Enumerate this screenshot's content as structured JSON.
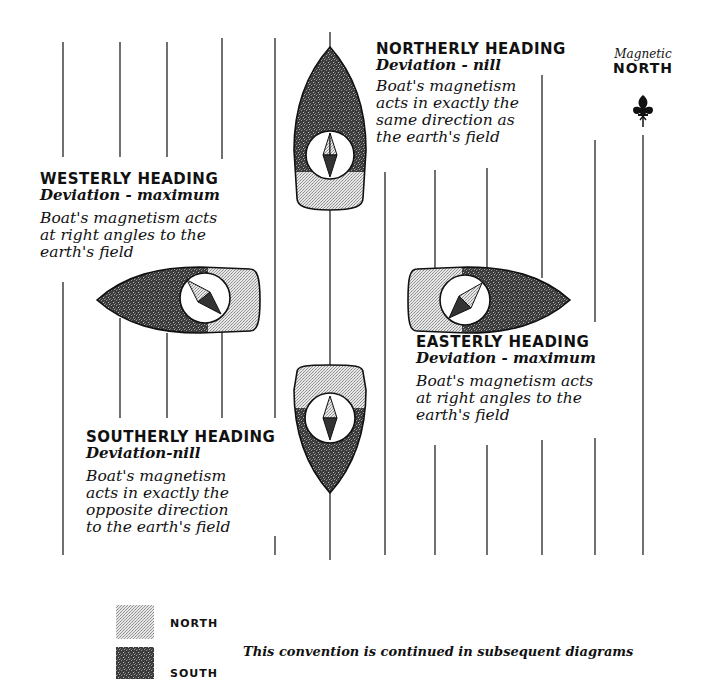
{
  "headings": {
    "northerly": {
      "title": "NORTHERLY HEADING",
      "deviation": "Deviation - nill",
      "body": [
        "Boat's magnetism",
        "acts in exactly the",
        "same direction as",
        "the earth's field"
      ]
    },
    "westerly": {
      "title": "WESTERLY HEADING",
      "deviation": "Deviation - maximum",
      "body": [
        "Boat's magnetism acts",
        "at right angles to the",
        "earth's field"
      ]
    },
    "easterly": {
      "title": "EASTERLY HEADING",
      "deviation": "Deviation - maximum",
      "body": [
        "Boat's magnetism acts",
        "at right angles to the",
        "earth's field"
      ]
    },
    "southerly": {
      "title": "SOUTHERLY HEADING",
      "deviation": "Deviation-nill",
      "body": [
        "Boat's magnetism",
        "acts in exactly the",
        "opposite direction",
        "to the earth's field"
      ]
    }
  },
  "magnetic_north": {
    "small": "Magnetic",
    "big": "NORTH",
    "icon": "fleur-de-lis-north-icon"
  },
  "legend": {
    "items": [
      {
        "label": "NORTH",
        "pattern": "light-stipple",
        "color": "#cfcfcf"
      },
      {
        "label": "SOUTH",
        "pattern": "dark-stipple",
        "color": "#4a4a4a"
      }
    ],
    "note": "This convention is continued in subsequent diagrams"
  },
  "colors": {
    "north_fill": "#d4d4d4",
    "south_fill": "#454545",
    "line": "#111111",
    "background": "#ffffff"
  }
}
